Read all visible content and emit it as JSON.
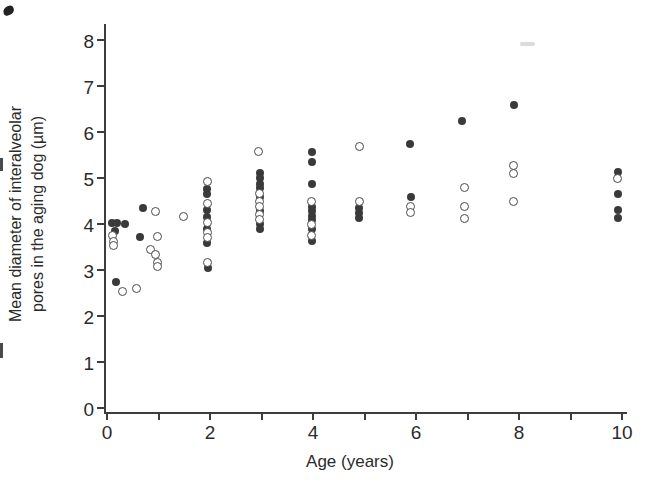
{
  "figure": {
    "background": "#ffffff",
    "ink_color": "#3d3d3d",
    "text_color": "#2b2b2b"
  },
  "chart_data": {
    "type": "scatter",
    "title": "",
    "xlabel": "Age (years)",
    "ylabel_lines": [
      "Mean diameter of interalveolar",
      "pores in the aging dog (µm)"
    ],
    "xlim": [
      0,
      10.3
    ],
    "ylim": [
      0,
      8.4
    ],
    "xticks": [
      0,
      2,
      4,
      6,
      8,
      10
    ],
    "x_minor_tick_step": 1,
    "yticks": [
      0,
      1,
      2,
      3,
      4,
      5,
      6,
      7,
      8
    ],
    "grid": false,
    "legend_position": "none",
    "series": [
      {
        "name": "solid circles",
        "marker": "filled-circle",
        "color": "#3a3a3a",
        "points": [
          [
            0.1,
            4.02
          ],
          [
            0.2,
            4.02
          ],
          [
            0.35,
            4.0
          ],
          [
            0.15,
            3.85
          ],
          [
            0.17,
            2.73
          ],
          [
            0.7,
            4.35
          ],
          [
            0.65,
            3.72
          ],
          [
            1.95,
            4.76
          ],
          [
            1.95,
            4.65
          ],
          [
            1.95,
            4.3
          ],
          [
            1.95,
            4.15
          ],
          [
            1.95,
            3.9
          ],
          [
            1.95,
            3.58
          ],
          [
            1.97,
            3.05
          ],
          [
            2.97,
            5.1
          ],
          [
            2.97,
            5.0
          ],
          [
            2.97,
            4.88
          ],
          [
            2.97,
            4.78
          ],
          [
            2.97,
            4.58
          ],
          [
            2.97,
            4.28
          ],
          [
            2.97,
            4.0
          ],
          [
            2.97,
            3.9
          ],
          [
            3.98,
            5.57
          ],
          [
            3.98,
            5.35
          ],
          [
            3.98,
            4.87
          ],
          [
            3.98,
            4.37
          ],
          [
            3.98,
            4.28
          ],
          [
            3.98,
            4.17
          ],
          [
            3.98,
            4.08
          ],
          [
            3.98,
            3.9
          ],
          [
            3.98,
            3.63
          ],
          [
            4.9,
            4.35
          ],
          [
            4.9,
            4.25
          ],
          [
            4.9,
            4.12
          ],
          [
            5.88,
            5.74
          ],
          [
            5.9,
            4.59
          ],
          [
            6.9,
            6.24
          ],
          [
            7.9,
            6.59
          ],
          [
            9.92,
            5.12
          ],
          [
            9.92,
            4.65
          ],
          [
            9.92,
            4.3
          ],
          [
            9.92,
            4.13
          ]
        ]
      },
      {
        "name": "open circles",
        "marker": "open-circle",
        "color": "#4a4a4a",
        "points": [
          [
            0.1,
            3.75
          ],
          [
            0.12,
            3.63
          ],
          [
            0.12,
            3.54
          ],
          [
            0.3,
            2.53
          ],
          [
            0.58,
            2.6
          ],
          [
            0.95,
            4.27
          ],
          [
            0.98,
            3.72
          ],
          [
            0.84,
            3.44
          ],
          [
            0.95,
            3.33
          ],
          [
            0.98,
            3.17
          ],
          [
            0.99,
            3.08
          ],
          [
            1.48,
            4.17
          ],
          [
            1.95,
            4.92
          ],
          [
            1.95,
            4.45
          ],
          [
            1.95,
            4.04
          ],
          [
            1.95,
            3.82
          ],
          [
            1.95,
            3.7
          ],
          [
            1.95,
            3.16
          ],
          [
            2.95,
            5.57
          ],
          [
            2.97,
            4.67
          ],
          [
            2.97,
            4.48
          ],
          [
            2.97,
            4.39
          ],
          [
            2.97,
            4.2
          ],
          [
            2.97,
            4.1
          ],
          [
            3.98,
            4.5
          ],
          [
            3.98,
            4.0
          ],
          [
            3.98,
            3.76
          ],
          [
            4.9,
            5.68
          ],
          [
            4.9,
            4.48
          ],
          [
            5.9,
            4.39
          ],
          [
            5.9,
            4.24
          ],
          [
            6.95,
            4.8
          ],
          [
            6.95,
            4.37
          ],
          [
            6.95,
            4.13
          ],
          [
            7.9,
            5.28
          ],
          [
            7.9,
            5.09
          ],
          [
            7.9,
            4.5
          ],
          [
            9.92,
            4.98
          ]
        ]
      }
    ]
  }
}
